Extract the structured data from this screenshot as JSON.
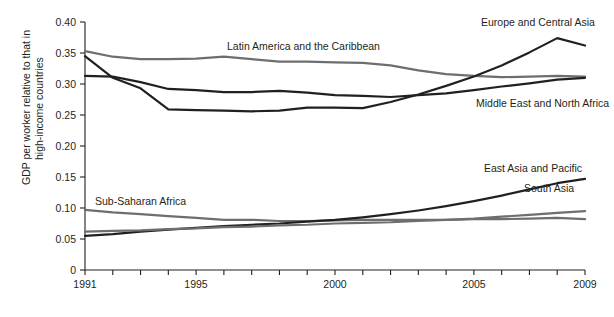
{
  "chart_data": {
    "type": "line",
    "title": "",
    "xlabel": "",
    "ylabel": "GDP per worker relative to that in high-income countries",
    "ylabel_line1": "GDP per worker relative to that in",
    "ylabel_line2": "high-income countries",
    "xlim": [
      1991,
      2009
    ],
    "ylim": [
      0,
      0.4
    ],
    "grid": false,
    "legend_position": "inline-annotations",
    "ytick_labels": [
      "0",
      "0.05",
      "0.10",
      "0.15",
      "0.20",
      "0.25",
      "0.30",
      "0.35",
      "0.40"
    ],
    "ytick_values": [
      0,
      0.05,
      0.1,
      0.15,
      0.2,
      0.25,
      0.3,
      0.35,
      0.4
    ],
    "xtick_values": [
      1991,
      1992,
      1993,
      1994,
      1995,
      1996,
      1997,
      1998,
      1999,
      2000,
      2001,
      2002,
      2003,
      2004,
      2005,
      2006,
      2007,
      2008,
      2009
    ],
    "xtick_labels_shown": [
      "1991",
      "1995",
      "2000",
      "2005",
      "2009"
    ],
    "x": [
      1991,
      1992,
      1993,
      1994,
      1995,
      1996,
      1997,
      1998,
      1999,
      2000,
      2001,
      2002,
      2003,
      2004,
      2005,
      2006,
      2007,
      2008,
      2009
    ],
    "series": [
      {
        "name": "Latin America and the Caribbean",
        "color": "#6d6e71",
        "label_x": 227,
        "label_y": 50,
        "values": [
          0.353,
          0.344,
          0.34,
          0.34,
          0.341,
          0.344,
          0.34,
          0.336,
          0.336,
          0.335,
          0.334,
          0.33,
          0.322,
          0.316,
          0.313,
          0.311,
          0.312,
          0.313,
          0.312
        ]
      },
      {
        "name": "Europe and Central Asia",
        "color": "#231f20",
        "label_x": 481,
        "label_y": 26,
        "values": [
          0.345,
          0.31,
          0.293,
          0.259,
          0.258,
          0.257,
          0.256,
          0.257,
          0.262,
          0.262,
          0.261,
          0.271,
          0.283,
          0.297,
          0.312,
          0.33,
          0.351,
          0.374,
          0.362
        ]
      },
      {
        "name": "Middle East and North Africa",
        "color": "#231f20",
        "label_x": 476,
        "label_y": 107,
        "values": [
          0.313,
          0.312,
          0.303,
          0.292,
          0.29,
          0.287,
          0.287,
          0.289,
          0.286,
          0.282,
          0.281,
          0.279,
          0.282,
          0.285,
          0.29,
          0.296,
          0.301,
          0.307,
          0.31
        ]
      },
      {
        "name": "Sub-Saharan Africa",
        "color": "#6d6e71",
        "label_x": 95,
        "label_y": 205,
        "values": [
          0.097,
          0.093,
          0.09,
          0.087,
          0.084,
          0.081,
          0.081,
          0.079,
          0.079,
          0.08,
          0.081,
          0.081,
          0.081,
          0.081,
          0.082,
          0.082,
          0.083,
          0.084,
          0.082
        ]
      },
      {
        "name": "East Asia and Pacific",
        "color": "#231f20",
        "label_x": 484,
        "label_y": 172,
        "values": [
          0.055,
          0.058,
          0.062,
          0.065,
          0.068,
          0.071,
          0.073,
          0.075,
          0.078,
          0.081,
          0.085,
          0.09,
          0.096,
          0.103,
          0.111,
          0.12,
          0.13,
          0.14,
          0.147
        ]
      },
      {
        "name": "South Asia",
        "color": "#6d6e71",
        "label_x": 524,
        "label_y": 192,
        "values": [
          0.062,
          0.063,
          0.064,
          0.066,
          0.067,
          0.069,
          0.07,
          0.072,
          0.073,
          0.075,
          0.076,
          0.077,
          0.079,
          0.081,
          0.083,
          0.086,
          0.089,
          0.092,
          0.095
        ]
      }
    ]
  },
  "colors": {
    "dark": "#231f20",
    "gray": "#6d6e71",
    "background": "#ffffff"
  }
}
